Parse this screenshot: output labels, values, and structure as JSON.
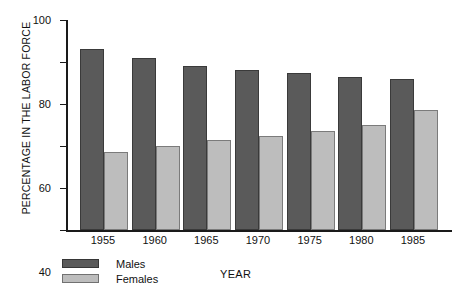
{
  "chart_data": {
    "type": "bar",
    "title": "",
    "xlabel": "YEAR",
    "ylabel": "PERCENTAGE IN THE LABOR FORCE",
    "categories": [
      "1955",
      "1960",
      "1965",
      "1970",
      "1975",
      "1980",
      "1985"
    ],
    "series": [
      {
        "name": "Males",
        "values": [
          86,
          82,
          78,
          76,
          75,
          73,
          72
        ],
        "color": "#5a5a5a"
      },
      {
        "name": "Females",
        "values": [
          37,
          40,
          43,
          45,
          47,
          50,
          57
        ],
        "color": "#bdbdbd"
      }
    ],
    "ylim": [
      0,
      100
    ],
    "y_ticks": [
      "0",
      "20",
      "40",
      "60",
      "80",
      "100"
    ],
    "y_tick_values": [
      0,
      20,
      40,
      60,
      80,
      100
    ],
    "grid": false,
    "legend_position": "bottom-left",
    "legend_entries": [
      "Males",
      "Females"
    ]
  }
}
